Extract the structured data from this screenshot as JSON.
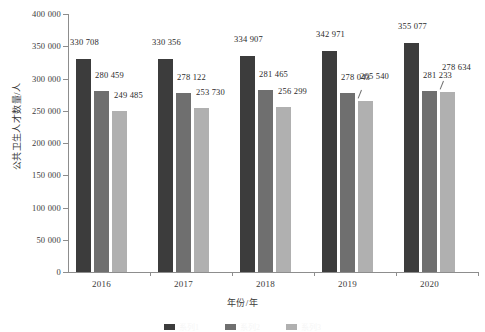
{
  "chart_data": {
    "type": "bar",
    "title": "",
    "subtitle": "",
    "xlabel": "年份/年",
    "ylabel": "公共卫生人才数量/人",
    "categories": [
      "2016",
      "2017",
      "2018",
      "2019",
      "2020"
    ],
    "ylim": [
      0,
      400000
    ],
    "ytick_values": [
      0,
      50000,
      100000,
      150000,
      200000,
      250000,
      300000,
      350000,
      400000
    ],
    "ytick_labels": [
      "0",
      "50 000",
      "100 000",
      "150 000",
      "200 000",
      "250 000",
      "300 000",
      "350 000",
      "400 000"
    ],
    "grid": false,
    "legend_position": "bottom-clipped",
    "series": [
      {
        "name": "系列1",
        "color": "#3c3c3c",
        "values": [
          330708,
          330356,
          334907,
          342971,
          355077
        ],
        "labels": [
          "330 708",
          "330 356",
          "334 907",
          "342 971",
          "355 077"
        ]
      },
      {
        "name": "系列2",
        "color": "#6f6f6f",
        "values": [
          280459,
          278122,
          281465,
          278043,
          281233
        ],
        "labels": [
          "280 459",
          "278 122",
          "281 465",
          "278 043",
          "281 233"
        ]
      },
      {
        "name": "系列3",
        "color": "#b0b0b0",
        "values": [
          249485,
          253730,
          256299,
          265540,
          278634
        ],
        "labels": [
          "249 485",
          "253 730",
          "256 299",
          "265 540",
          "278 634"
        ]
      }
    ]
  },
  "colors": {
    "series_dark": "#3c3c3c",
    "series_medium": "#6f6f6f",
    "series_light": "#b0b0b0",
    "axis": "#8d8d8d",
    "text": "#2b2b2b",
    "background": "#ffffff"
  }
}
